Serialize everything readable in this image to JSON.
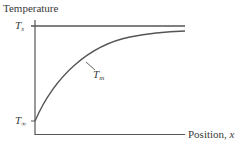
{
  "diagram": {
    "y_axis_label": "Temperature",
    "x_axis_label_prefix": "Position, ",
    "x_axis_label_var": "x",
    "levels": {
      "surface": {
        "symbol": "T",
        "subscript": "s"
      },
      "ambient": {
        "symbol": "T",
        "subscript": "∞"
      }
    },
    "curve_label": {
      "symbol": "T",
      "subscript": "m"
    },
    "colors": {
      "line": "#555555",
      "text": "#3a3a3a"
    }
  }
}
